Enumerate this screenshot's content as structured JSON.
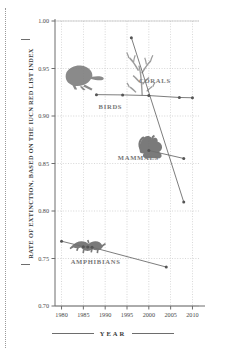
{
  "chart_data": {
    "type": "line",
    "title": "",
    "xlabel": "YEAR",
    "ylabel": "RATE OF EXTINCTION, BASED ON THE IUCN RED LIST INDEX",
    "xlim": [
      1978.5,
      2011.5
    ],
    "ylim": [
      0.7,
      1.0
    ],
    "xticks": [
      1980,
      1985,
      1990,
      1995,
      2000,
      2005,
      2010
    ],
    "xtick_labels": [
      "1980",
      "1985",
      "1990",
      "1995",
      "2000",
      "2005",
      "2010"
    ],
    "yticks": [
      0.7,
      0.75,
      0.8,
      0.85,
      0.9,
      0.95,
      1.0
    ],
    "ytick_labels": [
      "0.70",
      "0.75",
      "0.80",
      "0.85",
      "0.90",
      "0.95",
      "1.00"
    ],
    "grid": true,
    "grid_style": "dotted",
    "legend": "inline-labels",
    "line_color": "#6e6e6e",
    "marker_color": "#555555",
    "label_color": "#777777",
    "grid_color": "#bdbdbd",
    "axis_color": "#6d6d6d",
    "series": [
      {
        "name": "CORALS",
        "label": "CORALS",
        "label_x": 2001.4,
        "label_y": 0.9345,
        "icon": "coral-silhouette",
        "x": [
          1996,
          2008
        ],
        "y": [
          0.9825,
          0.8095
        ],
        "values": [
          0.9825,
          0.8095
        ]
      },
      {
        "name": "BIRDS",
        "label": "BIRDS",
        "label_x": 1991.2,
        "label_y": 0.9075,
        "icon": "bird-silhouette",
        "x": [
          1988,
          1994,
          2000,
          2007,
          2010
        ],
        "y": [
          0.9225,
          0.9222,
          0.9215,
          0.9195,
          0.9192
        ],
        "values": [
          0.9225,
          0.9222,
          0.9215,
          0.9195,
          0.9192
        ]
      },
      {
        "name": "MAMMALS",
        "label": "MAMMALS",
        "label_x": 1997.6,
        "label_y": 0.8535,
        "icon": "squirrel-silhouette",
        "x": [
          2000,
          2008
        ],
        "y": [
          0.8637,
          0.8553
        ],
        "values": [
          0.8637,
          0.8553
        ]
      },
      {
        "name": "AMPHIBIANS",
        "label": "AMPHIBIANS",
        "label_x": 1987.8,
        "label_y": 0.7445,
        "icon": "salamander-silhouette",
        "x": [
          1980,
          1985,
          1986,
          1987,
          2004
        ],
        "y": [
          0.7682,
          0.7625,
          0.7622,
          0.7618,
          0.741
        ],
        "values": [
          0.7682,
          0.7625,
          0.7622,
          0.7618,
          0.741
        ]
      }
    ]
  }
}
